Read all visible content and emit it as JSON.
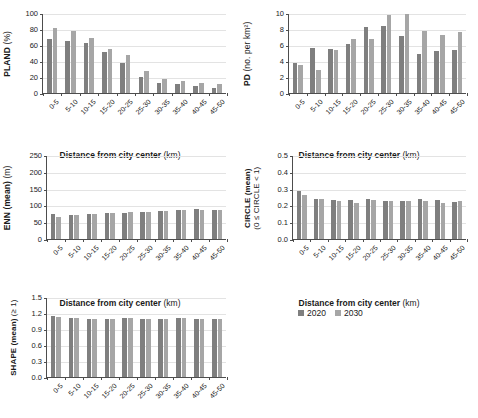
{
  "legend": {
    "items": [
      {
        "label": "2020",
        "color": "#7f7f7f"
      },
      {
        "label": "2030",
        "color": "#a6a6a6"
      }
    ]
  },
  "axis": {
    "xtitle_bold": "Distance from city center",
    "xtitle_unit": "(km)"
  },
  "categories": [
    "0-5",
    "5-10",
    "10-15",
    "15-20",
    "20-25",
    "25-30",
    "30-35",
    "35-40",
    "40-45",
    "45-50"
  ],
  "chart_data": [
    {
      "id": "pland",
      "type": "bar",
      "title": "",
      "ylabel_bold": "PLAND",
      "ylabel_unit": "(%)",
      "xlabel": "Distance from city center (km)",
      "ylim": [
        0,
        100
      ],
      "yticks": [
        "0",
        "20",
        "40",
        "60",
        "80",
        "100"
      ],
      "grid": true,
      "legend_position": "external",
      "categories": [
        "0-5",
        "5-10",
        "10-15",
        "15-20",
        "20-25",
        "25-30",
        "30-35",
        "35-40",
        "40-45",
        "45-50"
      ],
      "series": [
        {
          "name": "2020",
          "values": [
            67,
            65,
            63,
            51,
            38,
            20,
            13,
            11,
            9,
            6
          ]
        },
        {
          "name": "2030",
          "values": [
            81,
            77,
            69,
            55,
            47,
            27,
            17,
            15,
            13,
            11
          ]
        }
      ]
    },
    {
      "id": "pd",
      "type": "bar",
      "title": "",
      "ylabel_bold": "PD",
      "ylabel_unit": "(no. per km²)",
      "xlabel": "Distance from city center (km)",
      "ylim": [
        0,
        10
      ],
      "yticks": [
        "0",
        "2",
        "4",
        "6",
        "8",
        "10"
      ],
      "grid": true,
      "legend_position": "external",
      "categories": [
        "0-5",
        "5-10",
        "10-15",
        "15-20",
        "20-25",
        "25-30",
        "30-35",
        "35-40",
        "40-45",
        "45-50"
      ],
      "series": [
        {
          "name": "2020",
          "values": [
            3.7,
            5.6,
            5.5,
            6.1,
            8.3,
            8.4,
            7.1,
            4.9,
            5.2,
            5.4
          ]
        },
        {
          "name": "2030",
          "values": [
            3.5,
            2.9,
            5.4,
            6.7,
            6.7,
            9.8,
            9.9,
            7.8,
            7.2,
            7.6
          ]
        }
      ]
    },
    {
      "id": "enn",
      "type": "bar",
      "title": "",
      "ylabel_bold": "ENN (mean)",
      "ylabel_unit": "(m)",
      "xlabel": "Distance from city center (km)",
      "ylim": [
        0,
        250
      ],
      "yticks": [
        "0",
        "50",
        "100",
        "150",
        "200",
        "250"
      ],
      "grid": true,
      "legend_position": "external",
      "categories": [
        "0-5",
        "5-10",
        "10-15",
        "15-20",
        "20-25",
        "25-30",
        "30-35",
        "35-40",
        "40-45",
        "45-50"
      ],
      "series": [
        {
          "name": "2020",
          "values": [
            73,
            71,
            74,
            77,
            78,
            81,
            82,
            85,
            89,
            87
          ]
        },
        {
          "name": "2030",
          "values": [
            65,
            71,
            74,
            78,
            79,
            81,
            83,
            86,
            87,
            87
          ]
        }
      ]
    },
    {
      "id": "circle",
      "type": "bar",
      "title": "",
      "ylabel_bold": "CIRCLE (mean)",
      "ylabel_unit": "(0 ≤ CIRCLE < 1)",
      "xlabel": "Distance from city center (km)",
      "ylim": [
        0,
        0.5
      ],
      "yticks": [
        "0.0",
        "0.1",
        "0.2",
        "0.3",
        "0.4",
        "0.5"
      ],
      "grid": true,
      "legend_position": "external",
      "categories": [
        "0-5",
        "5-10",
        "10-15",
        "15-20",
        "20-25",
        "25-30",
        "30-35",
        "35-40",
        "40-45",
        "45-50"
      ],
      "series": [
        {
          "name": "2020",
          "values": [
            0.285,
            0.24,
            0.232,
            0.232,
            0.236,
            0.228,
            0.228,
            0.241,
            0.231,
            0.22
          ]
        },
        {
          "name": "2030",
          "values": [
            0.262,
            0.241,
            0.228,
            0.217,
            0.231,
            0.226,
            0.228,
            0.224,
            0.214,
            0.226
          ]
        }
      ]
    },
    {
      "id": "shape",
      "type": "bar",
      "title": "",
      "ylabel_bold": "SHAPE (mean)",
      "ylabel_unit": "(≥ 1)",
      "xlabel": "Distance from city center (km)",
      "ylim": [
        0,
        1.5
      ],
      "yticks": [
        "0.0",
        "0.3",
        "0.6",
        "0.9",
        "1.2",
        "1.5"
      ],
      "grid": true,
      "legend_position": "external",
      "categories": [
        "0-5",
        "5-10",
        "10-15",
        "15-20",
        "20-25",
        "25-30",
        "30-35",
        "35-40",
        "40-45",
        "45-50"
      ],
      "series": [
        {
          "name": "2020",
          "values": [
            1.135,
            1.112,
            1.097,
            1.097,
            1.102,
            1.095,
            1.095,
            1.108,
            1.096,
            1.092
          ]
        },
        {
          "name": "2030",
          "values": [
            1.122,
            1.112,
            1.097,
            1.095,
            1.1,
            1.096,
            1.095,
            1.105,
            1.094,
            1.095
          ]
        }
      ]
    }
  ]
}
